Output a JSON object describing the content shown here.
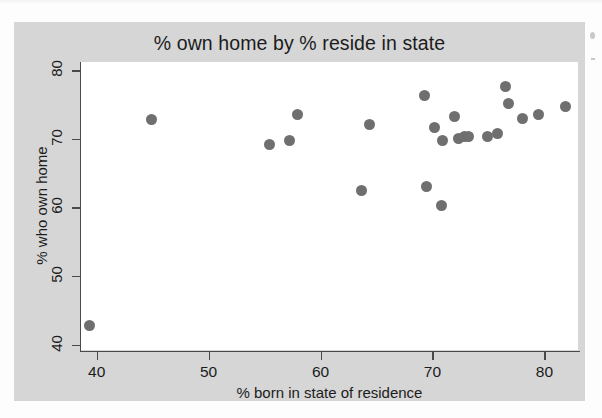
{
  "figure": {
    "title": "% own home by % reside in state",
    "panel_background": "#d6d6d6",
    "plot_background": "#ffffff",
    "marker_color": "#6f6f6f",
    "axis_color": "#4a4a4a"
  },
  "chart_data": {
    "type": "scatter",
    "title": "% own home by % reside in state",
    "xlabel": "% born in state of residence",
    "ylabel": "% who own home",
    "xlim": [
      38.6,
      83.0
    ],
    "ylim": [
      39.2,
      81.2
    ],
    "xticks": [
      40,
      50,
      60,
      70,
      80
    ],
    "yticks": [
      40,
      50,
      60,
      70,
      80
    ],
    "xtick_labels": [
      "40",
      "50",
      "60",
      "70",
      "80"
    ],
    "ytick_labels": [
      "40",
      "50",
      "60",
      "70",
      "80"
    ],
    "grid": false,
    "legend": null,
    "marker": "circle",
    "marker_color": "#6f6f6f",
    "points": [
      {
        "x": 39.4,
        "y": 42.8
      },
      {
        "x": 44.9,
        "y": 72.8
      },
      {
        "x": 55.4,
        "y": 69.2
      },
      {
        "x": 57.2,
        "y": 69.8
      },
      {
        "x": 57.9,
        "y": 73.5
      },
      {
        "x": 63.7,
        "y": 62.4
      },
      {
        "x": 64.4,
        "y": 72.1
      },
      {
        "x": 69.3,
        "y": 76.3
      },
      {
        "x": 69.5,
        "y": 63.1
      },
      {
        "x": 70.2,
        "y": 71.6
      },
      {
        "x": 70.8,
        "y": 60.3
      },
      {
        "x": 70.9,
        "y": 69.8
      },
      {
        "x": 72.0,
        "y": 73.3
      },
      {
        "x": 72.3,
        "y": 70.0
      },
      {
        "x": 72.9,
        "y": 70.4
      },
      {
        "x": 73.2,
        "y": 70.4
      },
      {
        "x": 74.9,
        "y": 70.4
      },
      {
        "x": 75.8,
        "y": 70.8
      },
      {
        "x": 76.5,
        "y": 77.6
      },
      {
        "x": 76.8,
        "y": 75.1
      },
      {
        "x": 78.0,
        "y": 72.9
      },
      {
        "x": 79.5,
        "y": 73.6
      },
      {
        "x": 81.9,
        "y": 74.7
      }
    ]
  },
  "axes": {
    "x": {
      "label": "% born in state of residence",
      "ticks": [
        {
          "value": 40,
          "label": "40"
        },
        {
          "value": 50,
          "label": "50"
        },
        {
          "value": 60,
          "label": "60"
        },
        {
          "value": 70,
          "label": "70"
        },
        {
          "value": 80,
          "label": "80"
        }
      ]
    },
    "y": {
      "label": "% who own home",
      "ticks": [
        {
          "value": 40,
          "label": "40"
        },
        {
          "value": 50,
          "label": "50"
        },
        {
          "value": 60,
          "label": "60"
        },
        {
          "value": 70,
          "label": "70"
        },
        {
          "value": 80,
          "label": "80"
        }
      ]
    }
  }
}
